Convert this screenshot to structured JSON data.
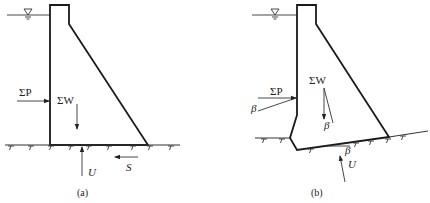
{
  "figure": {
    "panels": [
      {
        "id": "a",
        "caption": "(a)",
        "labels": {
          "water_pressure": "ΣP",
          "weight": "ΣW",
          "uplift": "U",
          "shear": "S"
        }
      },
      {
        "id": "b",
        "caption": "(b)",
        "labels": {
          "water_pressure": "ΣP",
          "weight": "ΣW",
          "uplift": "U",
          "angle_p": "β",
          "angle_w": "β",
          "angle_base": "β"
        }
      }
    ],
    "colors": {
      "line": "#1a1a1a",
      "background": "#ffffff"
    }
  }
}
